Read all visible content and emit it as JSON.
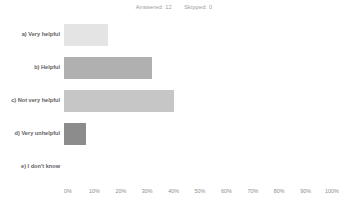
{
  "header": {
    "answered_label": "Answered: 12",
    "skipped_label": "Skipped: 0"
  },
  "chart_data": {
    "type": "bar",
    "orientation": "horizontal",
    "title": "",
    "subtitle": "",
    "xlabel": "",
    "ylabel": "",
    "xlim": [
      0,
      100
    ],
    "grid": false,
    "legend": "none",
    "answered": 12,
    "skipped": 0,
    "categories": [
      "a) Very helpful",
      "b) Helpful",
      "c) Not very helpful",
      "d) Very unhelpful",
      "e) I don't know"
    ],
    "values": [
      16.7,
      33.3,
      41.7,
      8.3,
      0
    ],
    "counts": [
      2,
      4,
      5,
      1,
      0
    ],
    "bar_colors": [
      "#e4e4e4",
      "#b0b0b0",
      "#c6c6c6",
      "#8c8c8c",
      "#b0b0b0"
    ],
    "tick_labels": [
      "0%",
      "10%",
      "20%",
      "30%",
      "40%",
      "50%",
      "60%",
      "70%",
      "80%",
      "90%",
      "100%"
    ],
    "tick_values": [
      0,
      10,
      20,
      30,
      40,
      50,
      60,
      70,
      80,
      90,
      100
    ]
  }
}
